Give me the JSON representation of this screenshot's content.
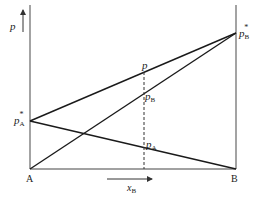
{
  "diagram": {
    "y_axis_label": "p",
    "x_axis_label": "x",
    "x_axis_label_sub": "B",
    "left_end_label": "A",
    "right_end_label": "B",
    "pA_star": {
      "main": "p",
      "sub": "A",
      "sup": "*"
    },
    "pB_star": {
      "main": "p",
      "sub": "B",
      "sup": "*"
    },
    "total_p": {
      "main": "p"
    },
    "partial_pB": {
      "main": "p",
      "sub": "B"
    },
    "partial_pA": {
      "main": "p",
      "sub": "A"
    },
    "colors": {
      "line": "#1a1a1a",
      "axis": "#555555",
      "text": "#222222"
    }
  }
}
